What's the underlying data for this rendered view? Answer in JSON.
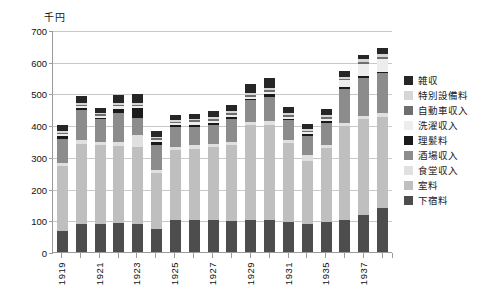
{
  "chart_data": {
    "type": "bar",
    "stacked": true,
    "title": "",
    "subtitle": "",
    "unit_label": "千円",
    "xlabel": "",
    "ylabel": "",
    "ylim": [
      0,
      700
    ],
    "ytick_step": 100,
    "yticks": [
      "700",
      "600",
      "500",
      "400",
      "300",
      "200",
      "100",
      "0"
    ],
    "grid": true,
    "legend_position": "right",
    "categories": [
      "1919",
      "1920",
      "1921",
      "1922",
      "1923",
      "1924",
      "1925",
      "1926",
      "1927",
      "1928",
      "1929",
      "1930",
      "1931",
      "1932",
      "1935",
      "1936",
      "1937",
      "1938"
    ],
    "xtick_labels": [
      "1919",
      "",
      "1921",
      "",
      "1923",
      "",
      "1925",
      "",
      "1927",
      "",
      "1929",
      "",
      "1931",
      "",
      "1935",
      "",
      "1937",
      ""
    ],
    "series": [
      {
        "name": "下宿料",
        "color": "#4d4d4d",
        "values": [
          65,
          88,
          88,
          90,
          88,
          72,
          100,
          100,
          102,
          98,
          100,
          102,
          95,
          88,
          95,
          100,
          118,
          138
        ]
      },
      {
        "name": "室料",
        "color": "#bfbfbf",
        "values": [
          205,
          252,
          248,
          245,
          242,
          178,
          222,
          225,
          228,
          240,
          300,
          298,
          248,
          200,
          232,
          298,
          300,
          288
        ]
      },
      {
        "name": "食堂収入",
        "color": "#e0e0e0",
        "values": [
          10,
          12,
          10,
          12,
          38,
          10,
          10,
          12,
          10,
          10,
          10,
          12,
          10,
          18,
          12,
          10,
          12,
          12
        ]
      },
      {
        "name": "酒場収入",
        "color": "#8c8c8c",
        "values": [
          78,
          95,
          72,
          92,
          55,
          78,
          62,
          58,
          62,
          72,
          68,
          78,
          62,
          60,
          68,
          105,
          120,
          125
        ]
      },
      {
        "name": "理髪料",
        "color": "#1a1a1a",
        "values": [
          8,
          6,
          6,
          12,
          30,
          10,
          6,
          6,
          6,
          6,
          6,
          8,
          6,
          6,
          6,
          6,
          6,
          6
        ]
      },
      {
        "name": "洗濯収入",
        "color": "#ededed",
        "values": [
          6,
          6,
          6,
          8,
          6,
          6,
          6,
          8,
          6,
          6,
          6,
          6,
          6,
          6,
          8,
          22,
          38,
          40
        ]
      },
      {
        "name": "自動車収入",
        "color": "#6e6e6e",
        "values": [
          5,
          6,
          5,
          6,
          5,
          5,
          5,
          6,
          6,
          6,
          5,
          6,
          5,
          5,
          6,
          6,
          6,
          6
        ]
      },
      {
        "name": "特別設備料",
        "color": "#d6d6d6",
        "values": [
          5,
          6,
          5,
          6,
          5,
          5,
          6,
          6,
          6,
          6,
          6,
          6,
          6,
          6,
          6,
          6,
          8,
          8
        ]
      },
      {
        "name": "雑収",
        "color": "#262626",
        "values": [
          18,
          22,
          15,
          25,
          28,
          18,
          16,
          16,
          18,
          20,
          28,
          32,
          18,
          16,
          18,
          18,
          12,
          22
        ]
      }
    ],
    "legend_entries": [
      {
        "label": "雑収",
        "color": "#262626"
      },
      {
        "label": "特別設備料",
        "color": "#d6d6d6"
      },
      {
        "label": "自動車収入",
        "color": "#6e6e6e"
      },
      {
        "label": "洗濯収入",
        "color": "#ededed"
      },
      {
        "label": "理髪料",
        "color": "#1a1a1a"
      },
      {
        "label": "酒場収入",
        "color": "#8c8c8c"
      },
      {
        "label": "食堂収入",
        "color": "#e0e0e0"
      },
      {
        "label": "室料",
        "color": "#bfbfbf"
      },
      {
        "label": "下宿料",
        "color": "#4d4d4d"
      }
    ],
    "axis_color": "#9a9a9a",
    "grid_color": "#c8c8c8"
  }
}
